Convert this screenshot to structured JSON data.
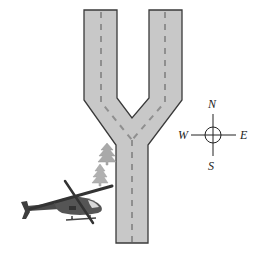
{
  "diagram": {
    "colors": {
      "road_fill": "#c8c8c8",
      "road_edge": "#3a3a3a",
      "center_line": "#8f8f8f",
      "helicopter": "#555555",
      "trees": "#a8a8a8"
    },
    "compass": {
      "north": "N",
      "south": "S",
      "east": "E",
      "west": "W"
    },
    "objects": [
      {
        "name": "road",
        "shape": "Y-fork"
      },
      {
        "name": "helicopter",
        "position": "lower-left, heading east"
      },
      {
        "name": "tree",
        "count": 2
      }
    ]
  }
}
